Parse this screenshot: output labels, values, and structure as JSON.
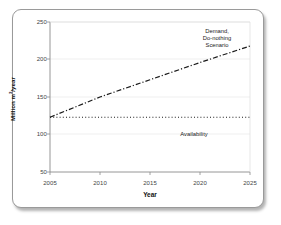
{
  "figure": {
    "background_color": "#ffffff",
    "frame_border_color": "#9a9a9a",
    "axis_color": "#8a8a8a",
    "gridline_color": "#e8e8e8",
    "series_color": "#1a1a1a"
  },
  "chart_data": {
    "type": "line",
    "title": "",
    "xlabel": "Year",
    "ylabel": "Million m3/year",
    "ylabel_prefix": "Million m",
    "ylabel_sup": "3",
    "ylabel_suffix": "/year",
    "xlim": [
      2005,
      2025
    ],
    "ylim": [
      50,
      250
    ],
    "xticks": [
      2005,
      2010,
      2015,
      2020,
      2025
    ],
    "yticks": [
      50,
      100,
      150,
      200,
      250
    ],
    "xtick_labels": [
      "2005",
      "2010",
      "2015",
      "2020",
      "2025"
    ],
    "ytick_labels": [
      "50",
      "100",
      "150",
      "200",
      "250"
    ],
    "grid": true,
    "grid_axis": "y",
    "legend": "none",
    "series": [
      {
        "name": "Demand, Do-nothing Scenario",
        "annotation": "Demand,\nDo-nothing\nScenario",
        "annotation_line1": "Demand,",
        "annotation_line2": "Do-nothing",
        "annotation_line3": "Scenario",
        "style": "dash-dot",
        "color": "#1a1a1a",
        "x": [
          2005,
          2010,
          2015,
          2020,
          2025
        ],
        "values": [
          123,
          150,
          173,
          196,
          218
        ]
      },
      {
        "name": "Availability",
        "annotation": "Availability",
        "annotation_line1": "Availability",
        "style": "dotted",
        "color": "#1a1a1a",
        "x": [
          2005,
          2025
        ],
        "values": [
          123,
          123
        ]
      }
    ]
  }
}
